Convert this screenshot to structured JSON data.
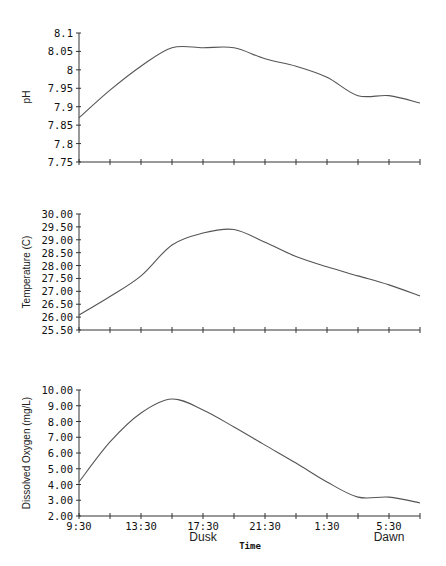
{
  "chart_data": [
    {
      "type": "line",
      "title": "",
      "ylabel": "pH",
      "xlabel": "",
      "ylim": [
        7.75,
        8.1
      ],
      "yticks": [
        "7.75",
        "7.8",
        "7.85",
        "7.9",
        "7.95",
        "8",
        "8.05",
        "8.1"
      ],
      "x": [
        "9:30",
        "11:30",
        "13:30",
        "15:30",
        "17:30",
        "19:30",
        "21:30",
        "23:30",
        "1:30",
        "3:30",
        "5:30",
        "7:30"
      ],
      "values": [
        7.87,
        7.945,
        8.01,
        8.06,
        8.06,
        8.06,
        8.03,
        8.01,
        7.98,
        7.93,
        7.93,
        7.91
      ],
      "grid": false
    },
    {
      "type": "line",
      "title": "",
      "ylabel": "Temperature (C)",
      "xlabel": "",
      "ylim": [
        25.5,
        30.0
      ],
      "yticks": [
        "25.50",
        "26.00",
        "26.50",
        "27.00",
        "27.50",
        "28.00",
        "28.50",
        "29.00",
        "29.50",
        "30.00"
      ],
      "x": [
        "9:30",
        "11:30",
        "13:30",
        "15:30",
        "17:30",
        "19:30",
        "21:30",
        "23:30",
        "1:30",
        "3:30",
        "5:30",
        "7:30"
      ],
      "values": [
        26.08,
        26.8,
        27.6,
        28.8,
        29.26,
        29.4,
        28.9,
        28.35,
        27.95,
        27.6,
        27.25,
        26.82
      ],
      "grid": false
    },
    {
      "type": "line",
      "title": "",
      "ylabel": "Dissolved Oxygen (mg/L)",
      "xlabel": "Time",
      "ylim": [
        2.0,
        10.0
      ],
      "yticks": [
        "2.00",
        "3.00",
        "4.00",
        "5.00",
        "6.00",
        "7.00",
        "8.00",
        "9.00",
        "10.00"
      ],
      "x": [
        "9:30",
        "11:30",
        "13:30",
        "15:30",
        "17:30",
        "19:30",
        "21:30",
        "23:30",
        "1:30",
        "3:30",
        "5:30",
        "7:30"
      ],
      "xtick_labels": [
        "9:30",
        "13:30",
        "17:30",
        "21:30",
        "1:30",
        "5:30"
      ],
      "annotations": [
        {
          "x": "17:30",
          "text": "Dusk"
        },
        {
          "x": "5:30",
          "text": "Dawn"
        }
      ],
      "values": [
        4.16,
        6.7,
        8.54,
        9.43,
        8.73,
        7.65,
        6.5,
        5.36,
        4.16,
        3.2,
        3.2,
        2.83
      ],
      "grid": false
    }
  ],
  "labels": {
    "ph_ylabel": "pH",
    "temp_ylabel": "Temperature (C)",
    "do_ylabel": "Dissolved Oxygen (mg/L)",
    "xlabel": "Time",
    "dusk": "Dusk",
    "dawn": "Dawn"
  },
  "colors": {
    "line": "#555555",
    "axis": "#333333"
  }
}
